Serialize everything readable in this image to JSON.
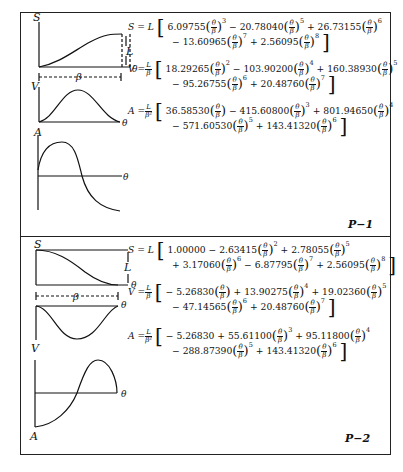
{
  "panels": [
    {
      "label": "P−1",
      "graphs": {
        "s_axis": "S",
        "v_axis": "V",
        "a_axis": "A",
        "theta": "θ",
        "beta": "β",
        "rise": "L"
      },
      "equations": [
        {
          "lhs": "S = L",
          "terms_line1": [
            {
              "sign": "",
              "coef": "6.09755",
              "exp": "3"
            },
            {
              "sign": "−",
              "coef": "20.78040",
              "exp": "5"
            },
            {
              "sign": "+",
              "coef": "26.73155",
              "exp": "6"
            }
          ],
          "terms_line2": [
            {
              "sign": "−",
              "coef": "13.60965",
              "exp": "7"
            },
            {
              "sign": "+",
              "coef": "2.56095",
              "exp": "8"
            }
          ]
        },
        {
          "lhs": "V =",
          "lhs_frac": {
            "num": "L",
            "den": "β"
          },
          "terms_line1": [
            {
              "sign": "",
              "coef": "18.29265",
              "exp": "2"
            },
            {
              "sign": "−",
              "coef": "103.90200",
              "exp": "4"
            },
            {
              "sign": "+",
              "coef": "160.38930",
              "exp": "5"
            }
          ],
          "terms_line2": [
            {
              "sign": "−",
              "coef": "95.26755",
              "exp": "6"
            },
            {
              "sign": "+",
              "coef": "20.48760",
              "exp": "7"
            }
          ]
        },
        {
          "lhs": "A =",
          "lhs_frac": {
            "num": "L",
            "den": "β²"
          },
          "terms_line1": [
            {
              "sign": "",
              "coef": "36.58530",
              "exp": ""
            },
            {
              "sign": "−",
              "coef": "415.60800",
              "exp": "3"
            },
            {
              "sign": "+",
              "coef": "801.94650",
              "exp": "4"
            }
          ],
          "terms_line2": [
            {
              "sign": "−",
              "coef": "571.60530",
              "exp": "5"
            },
            {
              "sign": "+",
              "coef": "143.41320",
              "exp": "6"
            }
          ]
        }
      ]
    },
    {
      "label": "P−2",
      "graphs": {
        "s_axis": "S",
        "v_axis": "V",
        "a_axis": "A",
        "theta": "θ",
        "beta": "β",
        "rise": "L"
      },
      "equations": [
        {
          "lhs": "S = L",
          "terms_line1": [
            {
              "sign": "",
              "coef": "1.00000",
              "exp": "none"
            },
            {
              "sign": "−",
              "coef": "2.63415",
              "exp": "2"
            },
            {
              "sign": "+",
              "coef": "2.78055",
              "exp": "5"
            }
          ],
          "terms_line2": [
            {
              "sign": "+",
              "coef": "3.17060",
              "exp": "6"
            },
            {
              "sign": "−",
              "coef": "6.87795",
              "exp": "7"
            },
            {
              "sign": "+",
              "coef": "2.56095",
              "exp": "8"
            }
          ]
        },
        {
          "lhs": "V =",
          "lhs_frac": {
            "num": "L",
            "den": "β"
          },
          "terms_line1": [
            {
              "sign": "−",
              "coef": "5.26830",
              "exp": ""
            },
            {
              "sign": "+",
              "coef": "13.90275",
              "exp": "4"
            },
            {
              "sign": "+",
              "coef": "19.02360",
              "exp": "5"
            }
          ],
          "terms_line2": [
            {
              "sign": "−",
              "coef": "47.14565",
              "exp": "6"
            },
            {
              "sign": "+",
              "coef": "20.48760",
              "exp": "7"
            }
          ]
        },
        {
          "lhs": "A =",
          "lhs_frac": {
            "num": "L",
            "den": "β²"
          },
          "terms_line1": [
            {
              "sign": "−",
              "coef": "5.26830",
              "exp": "none"
            },
            {
              "sign": "+",
              "coef": "55.61100",
              "exp": "3"
            },
            {
              "sign": "+",
              "coef": "95.11800",
              "exp": "4"
            }
          ],
          "terms_line2": [
            {
              "sign": "−",
              "coef": "288.87390",
              "exp": "5"
            },
            {
              "sign": "+",
              "coef": "143.41320",
              "exp": "6"
            }
          ]
        }
      ]
    }
  ],
  "symbols": {
    "theta": "θ",
    "beta": "β",
    "open": "[",
    "close": "]",
    "lpar": "(",
    "rpar": ")"
  }
}
